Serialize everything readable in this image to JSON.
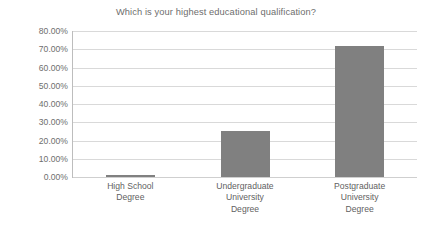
{
  "chart_data": {
    "type": "bar",
    "title": "Which is your highest educational qualification?",
    "xlabel": "",
    "ylabel": "",
    "categories": [
      "High School Degree",
      "Undergraduate University Degree",
      "Postgraduate University Degree"
    ],
    "category_lines": [
      [
        "High School",
        "Degree"
      ],
      [
        "Undergraduate",
        "University",
        "Degree"
      ],
      [
        "Postgraduate",
        "University",
        "Degree"
      ]
    ],
    "values": [
      1.0,
      25.0,
      72.0
    ],
    "value_labels": [
      "1.00%",
      "25.00%",
      "72.00%"
    ],
    "ylim": [
      0,
      80
    ],
    "ytick_values": [
      0,
      10,
      20,
      30,
      40,
      50,
      60,
      70,
      80
    ],
    "ytick_labels": [
      "0.00%",
      "10.00%",
      "20.00%",
      "30.00%",
      "40.00%",
      "50.00%",
      "60.00%",
      "70.00%",
      "80.00%"
    ],
    "grid": true,
    "legend": false,
    "legend_position": "none",
    "bar_color": "#808080",
    "gridline_color": "#d9d9d9",
    "axis_color": "#bdbdbd",
    "text_color": "#6e6e6e",
    "background_color": "#ffffff"
  }
}
